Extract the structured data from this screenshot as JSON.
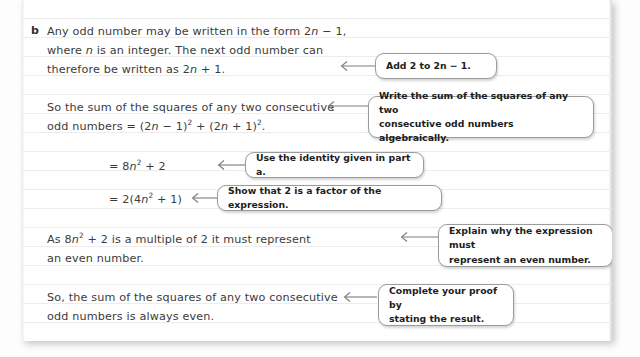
{
  "page": {
    "part_label": "b",
    "working_lines": [
      {
        "id": "w1",
        "text": "Any odd number may be written in the form 2n − 1,"
      },
      {
        "id": "w2",
        "text": "where n is an integer. The next odd number can"
      },
      {
        "id": "w3",
        "text": "therefore be written as 2n + 1."
      },
      {
        "id": "w4",
        "text": "So the sum of the squares of any two consecutive"
      },
      {
        "id": "w5",
        "text": "odd numbers = (2n − 1)² + (2n + 1)²."
      },
      {
        "id": "w6",
        "text": "= 8n² + 2"
      },
      {
        "id": "w7",
        "text": "= 2(4n² + 1)"
      },
      {
        "id": "w8",
        "text": "As 8n² + 2 is a multiple of 2 it must represent"
      },
      {
        "id": "w9",
        "text": "an even number."
      },
      {
        "id": "w10",
        "text": "So, the sum of the squares of any two consecutive"
      },
      {
        "id": "w11",
        "text": "odd numbers is always even."
      }
    ],
    "callouts": [
      {
        "id": "c1",
        "text": "Add 2 to 2n − 1."
      },
      {
        "id": "c2",
        "text": "Write the sum of the squares of any two\nconsecutive odd numbers algebraically."
      },
      {
        "id": "c3",
        "text": "Use the identity given in part a."
      },
      {
        "id": "c4",
        "text": "Show that 2 is a factor of the expression."
      },
      {
        "id": "c5",
        "text": "Explain why the expression must\nrepresent an even number."
      },
      {
        "id": "c6",
        "text": "Complete your proof by\nstating the result."
      }
    ]
  },
  "colors": {
    "page_background": "#ffffff",
    "rule_line": "#ececec",
    "handwriting_ink": "#3b3b3b",
    "callout_border": "#9b9b9b",
    "callout_text": "#1d1d1d",
    "arrow_stroke": "#7d7d7d"
  }
}
